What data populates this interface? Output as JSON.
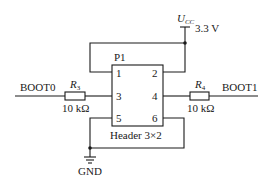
{
  "diagram": {
    "type": "schematic",
    "supply": {
      "label": "U",
      "label_sub": "CC",
      "voltage": "3.3 V"
    },
    "header": {
      "ref": "P1",
      "name": "Header 3×2",
      "pins": [
        "1",
        "2",
        "3",
        "4",
        "5",
        "6"
      ]
    },
    "resistors": [
      {
        "ref": "R",
        "ref_sub": "3",
        "value": "10 kΩ"
      },
      {
        "ref": "R",
        "ref_sub": "4",
        "value": "10 kΩ"
      }
    ],
    "nets": {
      "left": "BOOT0",
      "right": "BOOT1",
      "ground": "GND"
    },
    "colors": {
      "ink": "#1a1a1a",
      "background": "#ffffff"
    }
  }
}
